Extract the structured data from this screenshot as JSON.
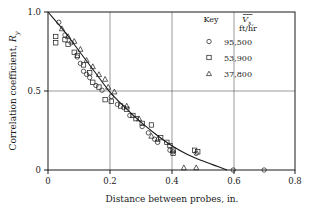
{
  "chart_data": {
    "type": "scatter",
    "title": "",
    "xlabel": "Distance between probes, in.",
    "ylabel": "Correlation coefficient, Ry",
    "xlim": [
      0,
      0.8
    ],
    "ylim": [
      0,
      1.0
    ],
    "xticks": [
      "0",
      "0.2",
      "0.4",
      "0.6",
      "0.8"
    ],
    "xtick_values": [
      0,
      0.2,
      0.4,
      0.6,
      0.8
    ],
    "yticks": [
      "0",
      "0.5",
      "1.0"
    ],
    "ytick_values": [
      0,
      0.5,
      1.0
    ],
    "grid": true,
    "grid_lines_x": [
      0.2,
      0.4,
      0.6
    ],
    "grid_lines_y": [
      0.5
    ],
    "legend_position": "upper-right",
    "legend_title_key": "Key",
    "legend_title_var": "Vx,",
    "legend_title_units": "ft/hr",
    "series": [
      {
        "name": "95,500",
        "marker": "circle",
        "points": [
          [
            0.035,
            0.935
          ],
          [
            0.055,
            0.855
          ],
          [
            0.075,
            0.805
          ],
          [
            0.095,
            0.715
          ],
          [
            0.105,
            0.675
          ],
          [
            0.115,
            0.625
          ],
          [
            0.125,
            0.605
          ],
          [
            0.135,
            0.585
          ],
          [
            0.155,
            0.535
          ],
          [
            0.175,
            0.505
          ],
          [
            0.205,
            0.465
          ],
          [
            0.225,
            0.415
          ],
          [
            0.245,
            0.395
          ],
          [
            0.265,
            0.345
          ],
          [
            0.305,
            0.275
          ],
          [
            0.325,
            0.235
          ],
          [
            0.345,
            0.195
          ],
          [
            0.355,
            0.175
          ],
          [
            0.395,
            0.125
          ],
          [
            0.405,
            0.115
          ],
          [
            0.48,
            0.105
          ],
          [
            0.6,
            0.0
          ],
          [
            0.7,
            0.0
          ]
        ]
      },
      {
        "name": "53,900",
        "marker": "square",
        "points": [
          [
            0.025,
            0.845
          ],
          [
            0.025,
            0.805
          ],
          [
            0.055,
            0.825
          ],
          [
            0.065,
            0.795
          ],
          [
            0.085,
            0.745
          ],
          [
            0.095,
            0.725
          ],
          [
            0.115,
            0.665
          ],
          [
            0.135,
            0.615
          ],
          [
            0.145,
            0.555
          ],
          [
            0.165,
            0.525
          ],
          [
            0.185,
            0.445
          ],
          [
            0.205,
            0.435
          ],
          [
            0.235,
            0.405
          ],
          [
            0.255,
            0.385
          ],
          [
            0.275,
            0.345
          ],
          [
            0.285,
            0.325
          ],
          [
            0.305,
            0.295
          ],
          [
            0.335,
            0.285
          ],
          [
            0.365,
            0.205
          ],
          [
            0.385,
            0.175
          ],
          [
            0.395,
            0.155
          ],
          [
            0.405,
            0.125
          ],
          [
            0.405,
            0.105
          ],
          [
            0.475,
            0.125
          ],
          [
            0.485,
            0.115
          ]
        ]
      },
      {
        "name": "37,800",
        "marker": "triangle",
        "points": [
          [
            0.045,
            0.895
          ],
          [
            0.065,
            0.845
          ],
          [
            0.085,
            0.815
          ],
          [
            0.105,
            0.765
          ],
          [
            0.125,
            0.695
          ],
          [
            0.145,
            0.655
          ],
          [
            0.165,
            0.605
          ],
          [
            0.185,
            0.575
          ],
          [
            0.195,
            0.525
          ],
          [
            0.215,
            0.495
          ],
          [
            0.255,
            0.405
          ],
          [
            0.295,
            0.325
          ],
          [
            0.335,
            0.215
          ],
          [
            0.355,
            0.195
          ],
          [
            0.44,
            0.015
          ],
          [
            0.48,
            0.015
          ]
        ]
      }
    ],
    "fit_curve": {
      "name": "fitted-correlation-curve",
      "points": [
        [
          0.0,
          1.0
        ],
        [
          0.05,
          0.885
        ],
        [
          0.1,
          0.755
        ],
        [
          0.15,
          0.625
        ],
        [
          0.2,
          0.495
        ],
        [
          0.25,
          0.395
        ],
        [
          0.3,
          0.305
        ],
        [
          0.35,
          0.225
        ],
        [
          0.4,
          0.155
        ],
        [
          0.45,
          0.1
        ],
        [
          0.5,
          0.058
        ],
        [
          0.55,
          0.022
        ],
        [
          0.58,
          0.0
        ]
      ]
    }
  }
}
